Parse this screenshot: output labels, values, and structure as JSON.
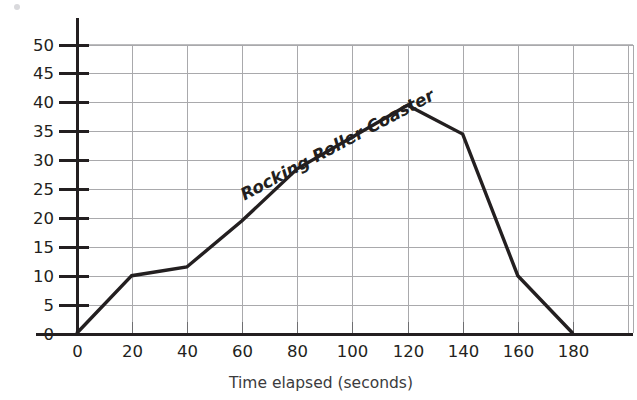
{
  "chart_data": {
    "type": "line",
    "title": "",
    "series_label": "Rocking Roller Coaster",
    "xlabel": "Time elapsed (seconds)",
    "ylabel": "",
    "xlim": [
      0,
      180
    ],
    "ylim": [
      0,
      50
    ],
    "grid": true,
    "legend": "none",
    "x_ticks": [
      0,
      20,
      40,
      60,
      80,
      100,
      120,
      140,
      160,
      180
    ],
    "x_tick_labels": [
      "0",
      "20",
      "40",
      "60",
      "80",
      "100",
      "120",
      "140",
      "160",
      "180"
    ],
    "y_ticks": [
      0,
      5,
      10,
      15,
      20,
      25,
      30,
      35,
      40,
      45,
      50
    ],
    "y_tick_labels": [
      "0",
      "5",
      "10",
      "15",
      "20",
      "25",
      "30",
      "35",
      "40",
      "45",
      "50"
    ],
    "x": [
      0,
      20,
      40,
      60,
      80,
      120,
      140,
      160,
      180
    ],
    "values": [
      0,
      10,
      11.5,
      19.5,
      28.5,
      39.5,
      34.5,
      10,
      0
    ],
    "series": [
      {
        "name": "Rocking Roller Coaster",
        "points": [
          {
            "x": 0,
            "y": 0
          },
          {
            "x": 20,
            "y": 10
          },
          {
            "x": 40,
            "y": 11.5
          },
          {
            "x": 60,
            "y": 19.5
          },
          {
            "x": 80,
            "y": 28.5
          },
          {
            "x": 120,
            "y": 39.5
          },
          {
            "x": 140,
            "y": 34.5
          },
          {
            "x": 160,
            "y": 10
          },
          {
            "x": 180,
            "y": 0
          }
        ],
        "color": "#231f20"
      }
    ],
    "colors": {
      "line": "#231f20",
      "grid": "#a9a9ac",
      "axis": "#231f20",
      "text": "#231f20",
      "background": "#ffffff"
    }
  }
}
